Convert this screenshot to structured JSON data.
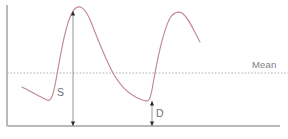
{
  "figure": {
    "background_color": "#ffffff",
    "width": 288,
    "height": 139
  },
  "axes": {
    "y_axis_name": "y-axis",
    "x_axis_name": "x-axis",
    "axis_color": "#b9b9b9",
    "y_axis": {
      "x": 7,
      "y_top": 5,
      "y_bottom": 126
    },
    "x_axis": {
      "y": 126,
      "x_left": 7,
      "x_right": 280
    }
  },
  "mean_reference": {
    "label": "Mean",
    "label_x": 252,
    "label_y": 68,
    "line_y": 73,
    "line_x_start": 7,
    "line_x_end": 288,
    "color": "#b0b0b0",
    "style": "dotted"
  },
  "measurements": [
    {
      "id": "systolic-amplitude",
      "label": "S",
      "label_x": 64,
      "label_y": 96,
      "label_anchor": "end",
      "x": 73,
      "y_top": 11,
      "y_bottom": 126,
      "description": "Systolic peak to baseline amplitude"
    },
    {
      "id": "diastolic-amplitude",
      "label": "D",
      "label_x": 156,
      "label_y": 117,
      "label_anchor": "start",
      "x": 152,
      "y_top": 101,
      "y_bottom": 126,
      "description": "Diastolic trough to baseline amplitude"
    }
  ],
  "chart_data": {
    "type": "line",
    "title": "",
    "xlabel": "",
    "ylabel": "",
    "grid": false,
    "legend": null,
    "curve_color": "#c2888f",
    "annotations": [
      {
        "text": "Mean",
        "x": 252,
        "y": 68
      },
      {
        "text": "S",
        "x": 64,
        "y": 96
      },
      {
        "text": "D",
        "x": 156,
        "y": 117
      }
    ],
    "reference_lines": [
      {
        "name": "Mean",
        "orientation": "horizontal",
        "y": 73,
        "style": "dotted"
      }
    ],
    "xlim": [
      7,
      288
    ],
    "ylim": [
      139,
      0
    ],
    "series": [
      {
        "name": "pulse-waveform",
        "path": "M22,87 C30,91 38,96 47,100 C51,102 53,96 56,80 C61,52 66,22 73,11 C79,3 85,7 91,22 C98,40 105,58 113,73 C122,89 133,98 146,101 C149,101.5 150,99 152,90 C156,66 162,33 170,18 C174,12 178,11 182,13 C188,17 192,27 200,42"
      }
    ]
  }
}
